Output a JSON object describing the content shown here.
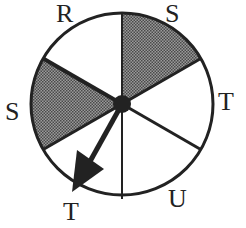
{
  "diagram": {
    "type": "spinner",
    "center": [
      122,
      104
    ],
    "radius": 91,
    "sectors": [
      {
        "label": "S",
        "start_deg": 0,
        "end_deg": 60,
        "shaded": true
      },
      {
        "label": "T",
        "start_deg": 60,
        "end_deg": 120,
        "shaded": false
      },
      {
        "label": "U",
        "start_deg": 120,
        "end_deg": 180,
        "shaded": false
      },
      {
        "label": "T",
        "start_deg": 180,
        "end_deg": 240,
        "shaded": false
      },
      {
        "label": "S",
        "start_deg": 240,
        "end_deg": 300,
        "shaded": true
      },
      {
        "label": "R",
        "start_deg": 300,
        "end_deg": 360,
        "shaded": false
      }
    ],
    "labels": {
      "top_left": "R",
      "top_right": "S",
      "right": "T",
      "bottom_right": "U",
      "bottom_left": "T",
      "left": "S"
    },
    "arrow_points_to": "T",
    "colors": {
      "shade": "#6e6e6e",
      "line": "#222222",
      "background": "#ffffff"
    }
  }
}
